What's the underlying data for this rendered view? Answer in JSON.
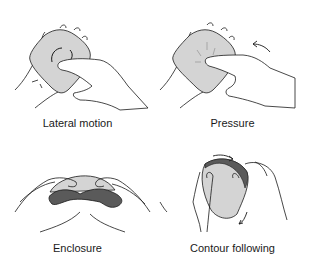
{
  "figure": {
    "panels": [
      {
        "id": "lateral-motion",
        "caption": "Lateral motion"
      },
      {
        "id": "pressure",
        "caption": "Pressure"
      },
      {
        "id": "enclosure",
        "caption": "Enclosure"
      },
      {
        "id": "contour-following",
        "caption": "Contour following"
      }
    ]
  },
  "colors": {
    "object_fill": "#d4d4d4",
    "object_dark": "#5a5a5a",
    "line": "#1a1a1a",
    "background": "#ffffff"
  }
}
